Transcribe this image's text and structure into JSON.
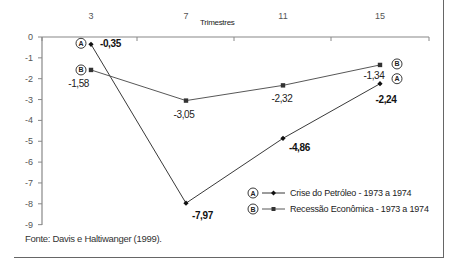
{
  "chart_data": {
    "type": "line",
    "title": "",
    "xlabel": "Trimestres",
    "ylabel": "",
    "x": [
      3,
      7,
      11,
      15
    ],
    "x_tick_labels": [
      "3",
      "7",
      "11",
      "15"
    ],
    "y_tick_labels": [
      "0",
      "-1",
      "-2",
      "-3",
      "-4",
      "-5",
      "-6",
      "-7",
      "-8",
      "-9"
    ],
    "ylim": [
      -9,
      0
    ],
    "grid": false,
    "x_axis_position": "top",
    "legend_position": "lower right inside",
    "series": [
      {
        "name": "Crise do Petróleo - 1973 a 1974",
        "badge": "A",
        "marker": "diamond",
        "values": [
          -0.35,
          -7.97,
          -4.86,
          -2.24
        ],
        "labels": [
          "-0,35",
          "-7,97",
          "-4,86",
          "-2,24"
        ],
        "color": "#222222"
      },
      {
        "name": "Recessão Econômica - 1973 a 1974",
        "badge": "B",
        "marker": "square",
        "values": [
          -1.58,
          -3.05,
          -2.32,
          -1.34
        ],
        "labels": [
          "-1,58",
          "-3,05",
          "-2,32",
          "-1,34"
        ],
        "color": "#444444"
      }
    ]
  },
  "source": "Fonte: Davis e Haltiwanger (1999)."
}
